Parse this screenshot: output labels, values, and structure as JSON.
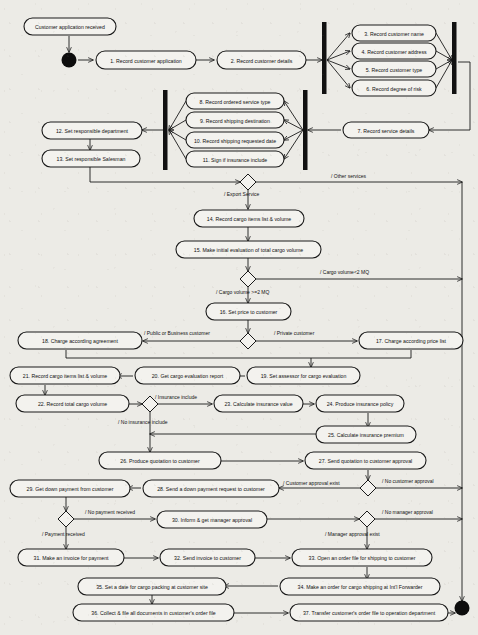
{
  "diagram": {
    "type": "uml-activity-diagram",
    "colors": {
      "background": "#ecebe6",
      "node_fill": "#f3f2ee",
      "stroke": "#1a1a1a",
      "terminator": "#0d0d0d"
    }
  },
  "start_note": {
    "label": "Customer application received"
  },
  "nodes": [
    {
      "id": "a1",
      "label": "1. Record customer application"
    },
    {
      "id": "a2",
      "label": "2. Record customer details"
    },
    {
      "id": "a3",
      "label": "3. Record customer name"
    },
    {
      "id": "a4",
      "label": "4. Record customer address"
    },
    {
      "id": "a5",
      "label": "5. Record customer type"
    },
    {
      "id": "a6",
      "label": "6. Record degree of risk"
    },
    {
      "id": "a7",
      "label": "7. Record service details"
    },
    {
      "id": "a8",
      "label": "8. Record ordered service type"
    },
    {
      "id": "a9",
      "label": "9. Record shipping destination"
    },
    {
      "id": "a10",
      "label": "10. Record shipping requested date"
    },
    {
      "id": "a11",
      "label": "11. Sign if insurance include"
    },
    {
      "id": "a12",
      "label": "12. Set responsible department"
    },
    {
      "id": "a13",
      "label": "13. Set responsible Salesman"
    },
    {
      "id": "a14",
      "label": "14. Record cargo items list & volume"
    },
    {
      "id": "a15",
      "label": "15. Make initial evaluation of total cargo volume"
    },
    {
      "id": "a16",
      "label": "16. Set price to customer"
    },
    {
      "id": "a17",
      "label": "17. Charge according price list"
    },
    {
      "id": "a18",
      "label": "18. Charge according agreement"
    },
    {
      "id": "a19",
      "label": "19. Set assessor for cargo evaluation"
    },
    {
      "id": "a20",
      "label": "20. Get cargo evaluation report"
    },
    {
      "id": "a21",
      "label": "21. Record cargo items list & volume"
    },
    {
      "id": "a22",
      "label": "22. Record total cargo volume"
    },
    {
      "id": "a23",
      "label": "23. Calculate insurance value"
    },
    {
      "id": "a24",
      "label": "24. Produce insurance policy"
    },
    {
      "id": "a25",
      "label": "25. Calculate insurance premium"
    },
    {
      "id": "a26",
      "label": "26. Produce quotation to customer"
    },
    {
      "id": "a27",
      "label": "27. Send quotation to customer approval"
    },
    {
      "id": "a28",
      "label": "28. Send a down payment request to customer"
    },
    {
      "id": "a29",
      "label": "29. Get down payment from customer"
    },
    {
      "id": "a30",
      "label": "30. Inform & get manager approval"
    },
    {
      "id": "a31",
      "label": "31. Make an invoice for payment"
    },
    {
      "id": "a32",
      "label": "32. Send invoice to customer"
    },
    {
      "id": "a33",
      "label": "33. Open an order file for shipping to customer"
    },
    {
      "id": "a34",
      "label": "34. Make an order for cargo shipping at Int'l Forwarder"
    },
    {
      "id": "a35",
      "label": "35. Set a date for cargo packing at customer site"
    },
    {
      "id": "a36",
      "label": "36. Collect & file all documents in customer's order file"
    },
    {
      "id": "a37",
      "label": "37. Transfer customer's order file to operation department"
    }
  ],
  "guards": [
    {
      "id": "g_export",
      "label": "/ Export Service"
    },
    {
      "id": "g_other",
      "label": "/ Other services"
    },
    {
      "id": "g_volge",
      "label": "/ Cargo volume >=2 MQ"
    },
    {
      "id": "g_vollt",
      "label": "/ Cargo volume<2 MQ"
    },
    {
      "id": "g_public",
      "label": "/ Public or Business customer"
    },
    {
      "id": "g_private",
      "label": "/ Private customer"
    },
    {
      "id": "g_ins",
      "label": "/ Insurance include"
    },
    {
      "id": "g_noins",
      "label": "/ No insurance include"
    },
    {
      "id": "g_custok",
      "label": "/ Customer approval exist"
    },
    {
      "id": "g_custno",
      "label": "/ No customer approval"
    },
    {
      "id": "g_payok",
      "label": "/ Payment received"
    },
    {
      "id": "g_payno",
      "label": "/ No payment received"
    },
    {
      "id": "g_mgrok",
      "label": "/  Manager approval exist"
    },
    {
      "id": "g_mgrno",
      "label": "/ No manager approval"
    }
  ]
}
